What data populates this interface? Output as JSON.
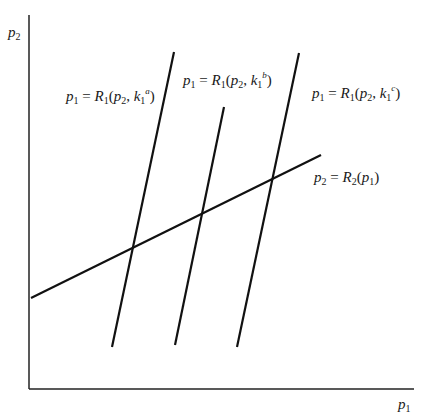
{
  "diagram": {
    "axes": {
      "y_label": {
        "var": "p",
        "sub": "2"
      },
      "x_label": {
        "var": "p",
        "sub": "1"
      }
    },
    "curves": [
      {
        "id": "R1_a",
        "lhs_var": "p",
        "lhs_sub": "1",
        "eq": "=",
        "func": "R",
        "func_sub": "1",
        "arg1_var": "p",
        "arg1_sub": "2",
        "arg2_var": "k",
        "arg2_sub": "1",
        "arg2_sup": "a"
      },
      {
        "id": "R1_b",
        "lhs_var": "p",
        "lhs_sub": "1",
        "eq": "=",
        "func": "R",
        "func_sub": "1",
        "arg1_var": "p",
        "arg1_sub": "2",
        "arg2_var": "k",
        "arg2_sub": "1",
        "arg2_sup": "b"
      },
      {
        "id": "R1_c",
        "lhs_var": "p",
        "lhs_sub": "1",
        "eq": "=",
        "func": "R",
        "func_sub": "1",
        "arg1_var": "p",
        "arg1_sub": "2",
        "arg2_var": "k",
        "arg2_sub": "1",
        "arg2_sup": "c"
      },
      {
        "id": "R2",
        "lhs_var": "p",
        "lhs_sub": "2",
        "eq": "=",
        "func": "R",
        "func_sub": "2",
        "arg1_var": "p",
        "arg1_sub": "1"
      }
    ],
    "line_color": "#111111"
  }
}
